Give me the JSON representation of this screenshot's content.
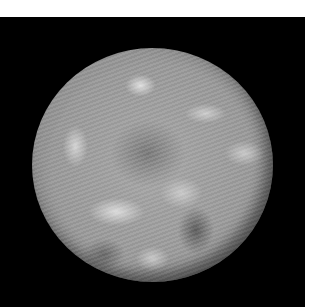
{
  "image": {
    "subject": "planet-photograph",
    "description": "Grayscale photograph of a cloud-covered planet (Earth) viewed from space on a black background",
    "colors": {
      "background": "#000000",
      "margin": "#ffffff",
      "planet_mid": "#9a9a9a",
      "cloud": "#e6e6e6",
      "dark_region": "#6e6e6e"
    }
  }
}
